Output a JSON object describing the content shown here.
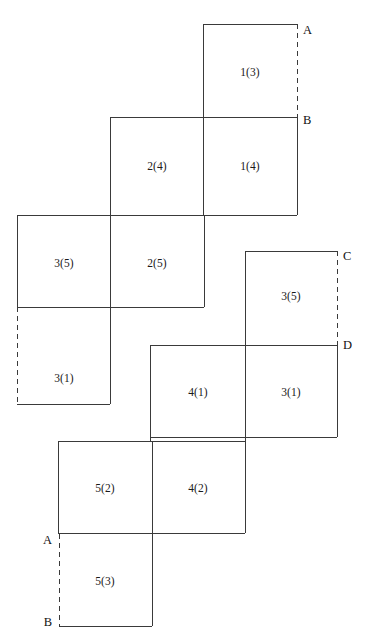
{
  "figure": {
    "width": 366,
    "height": 641,
    "background_color": "#ffffff",
    "stroke_color": "#3a3a3a",
    "stroke_width": 1,
    "dashed_stroke_color": "#3a3a3a",
    "dash_pattern": "5,4"
  },
  "cells": [
    {
      "name": "cell-1-3",
      "label": "1(3)",
      "x1": 203,
      "y1": 24,
      "x2": 297,
      "y2": 117,
      "cx": 250,
      "cy": 72
    },
    {
      "name": "cell-2-4",
      "label": "2(4)",
      "x1": 110,
      "y1": 118,
      "x2": 203,
      "y2": 215,
      "cx": 157,
      "cy": 166
    },
    {
      "name": "cell-1-4",
      "label": "1(4)",
      "x1": 203,
      "y1": 118,
      "x2": 297,
      "y2": 215,
      "cx": 250,
      "cy": 166
    },
    {
      "name": "cell-3-5a",
      "label": "3(5)",
      "x1": 17,
      "y1": 215,
      "x2": 110,
      "y2": 307,
      "cx": 64,
      "cy": 263
    },
    {
      "name": "cell-2-5",
      "label": "2(5)",
      "x1": 110,
      "y1": 215,
      "x2": 204,
      "y2": 307,
      "cx": 157,
      "cy": 263
    },
    {
      "name": "cell-3-1a",
      "label": "3(1)",
      "x1": 17,
      "y1": 307,
      "x2": 110,
      "y2": 404,
      "cx": 64,
      "cy": 378
    },
    {
      "name": "cell-3-5b",
      "label": "3(5)",
      "x1": 245,
      "y1": 251,
      "x2": 337,
      "y2": 345,
      "cx": 291,
      "cy": 296
    },
    {
      "name": "cell-4-1",
      "label": "4(1)",
      "x1": 150,
      "y1": 345,
      "x2": 245,
      "y2": 437,
      "cx": 198,
      "cy": 392
    },
    {
      "name": "cell-3-1b",
      "label": "3(1)",
      "x1": 245,
      "y1": 345,
      "x2": 337,
      "y2": 437,
      "cx": 291,
      "cy": 392
    },
    {
      "name": "cell-5-2",
      "label": "5(2)",
      "x1": 58,
      "y1": 441,
      "x2": 152,
      "y2": 533,
      "cx": 105,
      "cy": 488
    },
    {
      "name": "cell-4-2",
      "label": "4(2)",
      "x1": 152,
      "y1": 441,
      "x2": 245,
      "y2": 533,
      "cx": 198,
      "cy": 488
    },
    {
      "name": "cell-5-3",
      "label": "5(3)",
      "x1": 59,
      "y1": 534,
      "x2": 152,
      "y2": 626,
      "cx": 105,
      "cy": 581
    }
  ],
  "solid_segments": [
    {
      "name": "seg-1-3-top",
      "x1": 203,
      "y1": 24,
      "x2": 297,
      "y2": 24
    },
    {
      "name": "seg-1-3-left",
      "x1": 203,
      "y1": 24,
      "x2": 203,
      "y2": 118
    },
    {
      "name": "seg-b-row-top",
      "x1": 110,
      "y1": 117,
      "x2": 297,
      "y2": 117
    },
    {
      "name": "seg-2-4-left",
      "x1": 110,
      "y1": 117,
      "x2": 110,
      "y2": 215
    },
    {
      "name": "seg-1-4-right",
      "x1": 297,
      "y1": 117,
      "x2": 297,
      "y2": 215
    },
    {
      "name": "seg-2-4-1-4-div",
      "x1": 203,
      "y1": 117,
      "x2": 203,
      "y2": 215
    },
    {
      "name": "seg-row2-bottom",
      "x1": 110,
      "y1": 215,
      "x2": 297,
      "y2": 215
    },
    {
      "name": "seg-3-5a-top",
      "x1": 17,
      "y1": 215,
      "x2": 110,
      "y2": 215
    },
    {
      "name": "seg-3-5a-left",
      "x1": 17,
      "y1": 215,
      "x2": 17,
      "y2": 307
    },
    {
      "name": "seg-3-5a-2-5-div",
      "x1": 110,
      "y1": 215,
      "x2": 110,
      "y2": 404
    },
    {
      "name": "seg-2-5-bottom",
      "x1": 17,
      "y1": 307,
      "x2": 204,
      "y2": 307
    },
    {
      "name": "seg-2-5-right",
      "x1": 204,
      "y1": 215,
      "x2": 204,
      "y2": 307
    },
    {
      "name": "seg-3-1a-bottom",
      "x1": 17,
      "y1": 404,
      "x2": 110,
      "y2": 404
    },
    {
      "name": "seg-3-5b-top",
      "x1": 245,
      "y1": 251,
      "x2": 337,
      "y2": 251
    },
    {
      "name": "seg-3-5b-left",
      "x1": 245,
      "y1": 251,
      "x2": 245,
      "y2": 345
    },
    {
      "name": "seg-d-row-top",
      "x1": 150,
      "y1": 345,
      "x2": 337,
      "y2": 345
    },
    {
      "name": "seg-4-1-left",
      "x1": 150,
      "y1": 345,
      "x2": 150,
      "y2": 441
    },
    {
      "name": "seg-3-1b-right",
      "x1": 337,
      "y1": 345,
      "x2": 337,
      "y2": 437
    },
    {
      "name": "seg-4-1-3-1b-div",
      "x1": 245,
      "y1": 345,
      "x2": 245,
      "y2": 533
    },
    {
      "name": "seg-row4-bottom",
      "x1": 150,
      "y1": 437,
      "x2": 337,
      "y2": 437
    },
    {
      "name": "seg-5-2-top",
      "x1": 58,
      "y1": 441,
      "x2": 245,
      "y2": 441
    },
    {
      "name": "seg-5-2-left",
      "x1": 58,
      "y1": 441,
      "x2": 58,
      "y2": 534
    },
    {
      "name": "seg-5-2-4-2-div",
      "x1": 152,
      "y1": 441,
      "x2": 152,
      "y2": 626
    },
    {
      "name": "seg-row5-bottom",
      "x1": 58,
      "y1": 533,
      "x2": 245,
      "y2": 533
    },
    {
      "name": "seg-5-3-bottom",
      "x1": 59,
      "y1": 626,
      "x2": 152,
      "y2": 626
    }
  ],
  "dashed_segments": [
    {
      "name": "dash-a-to-b-right",
      "x1": 297,
      "y1": 24,
      "x2": 297,
      "y2": 117
    },
    {
      "name": "dash-c-to-d-right",
      "x1": 337,
      "y1": 251,
      "x2": 337,
      "y2": 345
    },
    {
      "name": "dash-3-1a-left",
      "x1": 17,
      "y1": 307,
      "x2": 17,
      "y2": 404
    },
    {
      "name": "dash-a-to-b-left",
      "x1": 59,
      "y1": 534,
      "x2": 59,
      "y2": 626
    }
  ],
  "point_labels": [
    {
      "name": "point-label-a-top",
      "text": "A",
      "x": 303,
      "y": 30,
      "align": "right"
    },
    {
      "name": "point-label-b-top",
      "text": "B",
      "x": 303,
      "y": 120,
      "align": "right"
    },
    {
      "name": "point-label-c",
      "text": "C",
      "x": 343,
      "y": 256,
      "align": "right"
    },
    {
      "name": "point-label-d",
      "text": "D",
      "x": 343,
      "y": 345,
      "align": "right"
    },
    {
      "name": "point-label-a-bottom",
      "text": "A",
      "x": 52,
      "y": 540,
      "align": "left"
    },
    {
      "name": "point-label-b-bottom",
      "text": "B",
      "x": 52,
      "y": 622,
      "align": "left"
    }
  ]
}
